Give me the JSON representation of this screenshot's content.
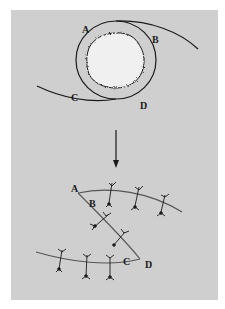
{
  "figure": {
    "background_color": "#cfcfcf",
    "line_color": "#1a1a1a",
    "blob_color": "#f2f2f2",
    "top_panel": {
      "description": "Eye-shaped closure: round lesion encircled by curved incision lines",
      "labels": {
        "a": "A",
        "b": "B",
        "c": "C",
        "d": "D"
      }
    },
    "arrow": {
      "direction": "down"
    },
    "bottom_panel": {
      "description": "Z-shaped incision closure with interrupted sutures",
      "labels": {
        "a": "A",
        "b": "B",
        "c": "C",
        "d": "D"
      },
      "suture_count": 8
    }
  }
}
